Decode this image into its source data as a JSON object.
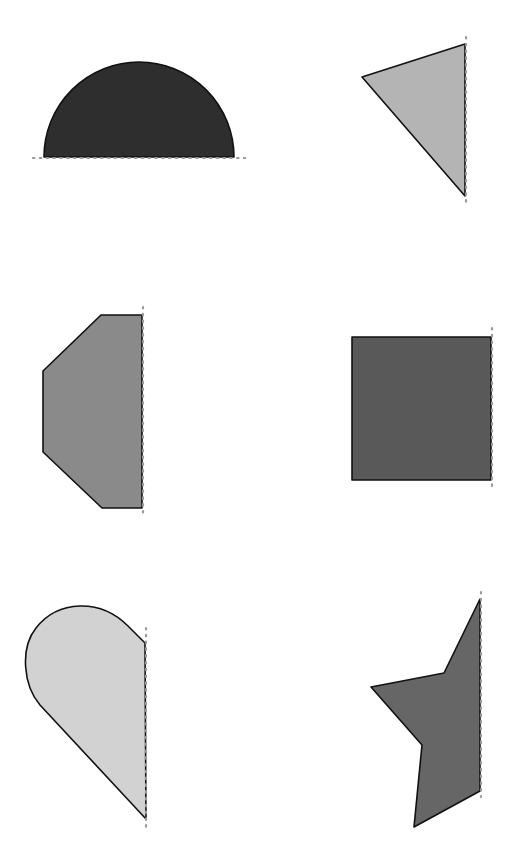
{
  "diagram": {
    "background": "#ffffff",
    "stroke_color": "#111111",
    "axis_color": "#9a9a9a",
    "shapes": [
      {
        "id": "half-circle",
        "kind": "semicircle",
        "fill": "#2e2e2e",
        "axis": "horizontal",
        "path": "M 44 157 A 95 95 0 0 1 234 157 Z",
        "axis_line": {
          "x1": 33,
          "y1": 158,
          "x2": 247,
          "y2": 158
        }
      },
      {
        "id": "triangle",
        "kind": "triangle",
        "fill": "#b4b4b4",
        "axis": "vertical",
        "path": "M 465 44 L 362 77 L 465 196 Z",
        "axis_line": {
          "x1": 466,
          "y1": 37,
          "x2": 466,
          "y2": 206
        }
      },
      {
        "id": "half-octagon",
        "kind": "hexagon-half",
        "fill": "#8a8a8a",
        "axis": "vertical",
        "path": "M 142 315 L 101 315 L 43 371 L 43 452 L 102 508 L 142 508 Z",
        "axis_line": {
          "x1": 143,
          "y1": 307,
          "x2": 143,
          "y2": 514
        }
      },
      {
        "id": "square",
        "kind": "rectangle",
        "fill": "#595959",
        "axis": "vertical",
        "path": "M 352 337 L 491 337 L 491 480 L 352 480 Z",
        "axis_line": {
          "x1": 492,
          "y1": 328,
          "x2": 492,
          "y2": 488
        }
      },
      {
        "id": "half-teardrop",
        "kind": "teardrop-half",
        "fill": "#d2d2d2",
        "axis": "vertical",
        "path": "M 145 643 L 128 626 C 100 598 58 600 36 628 C 20 648 23 685 40 705 L 146 819 Z",
        "axis_line": {
          "x1": 146,
          "y1": 628,
          "x2": 146,
          "y2": 830
        }
      },
      {
        "id": "half-star",
        "kind": "star-half",
        "fill": "#666666",
        "axis": "vertical",
        "path": "M 480 599 L 444 673 L 371 687 L 422 745 L 414 827 L 480 791 Z",
        "axis_line": {
          "x1": 481,
          "y1": 592,
          "x2": 481,
          "y2": 797
        }
      }
    ]
  }
}
